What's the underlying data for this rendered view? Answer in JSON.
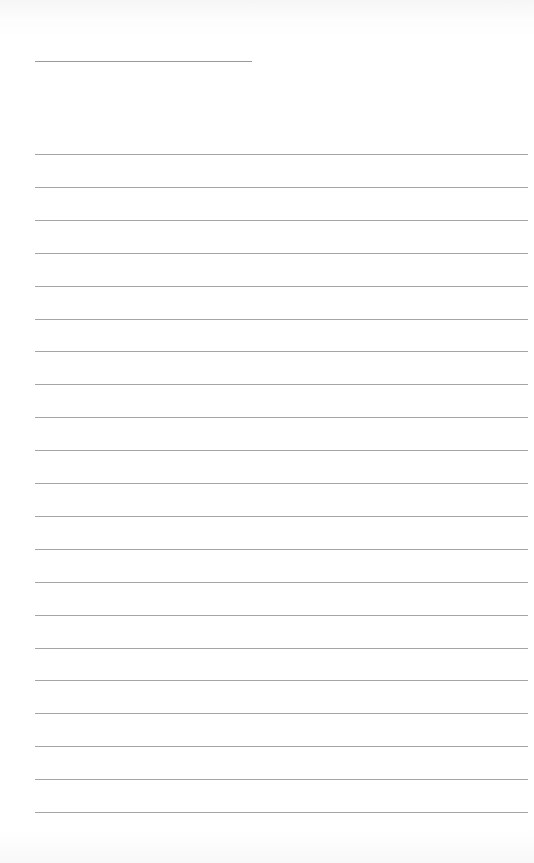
{
  "page": {
    "type": "lined-paper",
    "title_line": {
      "present": true
    },
    "rules": {
      "count": 21,
      "first_y": 154,
      "spacing": 32.9
    },
    "colors": {
      "paper": "#ffffff",
      "rule": "#a5a5a5"
    }
  }
}
